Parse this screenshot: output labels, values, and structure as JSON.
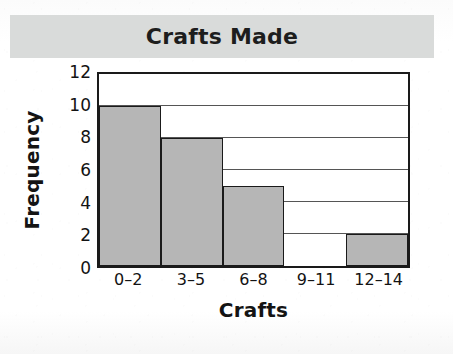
{
  "chart_data": {
    "type": "bar",
    "title": "Crafts Made",
    "xlabel": "Crafts",
    "ylabel": "Frequency",
    "categories": [
      "0–2",
      "3–5",
      "6–8",
      "9–11",
      "12–14"
    ],
    "values": [
      10,
      8,
      5,
      0,
      2
    ],
    "ylim": [
      0,
      12
    ],
    "y_ticks": [
      0,
      2,
      4,
      6,
      8,
      10,
      12
    ],
    "gridlines": [
      2,
      4,
      6,
      8,
      10
    ],
    "grid": true,
    "legend": null,
    "bar_fill_color": "#b6b6b6",
    "bar_edge_color": "#1a1a1a",
    "frame_color": "#1a1a1a",
    "plot_background": "#ffffff",
    "title_banner_color": "#d9dbda",
    "page_background": "#fdfdfd"
  }
}
